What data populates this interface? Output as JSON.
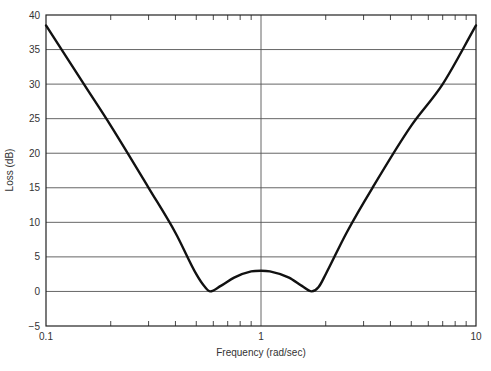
{
  "chart_data": {
    "type": "line",
    "title": "",
    "xlabel": "Frequency (rad/sec)",
    "ylabel": "Loss (dB)",
    "xscale": "log",
    "xlim": [
      0.1,
      10
    ],
    "ylim": [
      -5,
      40
    ],
    "x_tick_labels": [
      "0.1",
      "1",
      "10"
    ],
    "y_tick_labels": [
      "40",
      "35",
      "30",
      "25",
      "20",
      "15",
      "10",
      "5",
      "0",
      "−5"
    ],
    "y_ticks": [
      40,
      35,
      30,
      25,
      20,
      15,
      10,
      5,
      0,
      -5
    ],
    "grid": {
      "horizontal": true,
      "vertical_at": [
        1
      ]
    },
    "legend": null,
    "series": [
      {
        "name": "Loss",
        "x": [
          0.1,
          0.15,
          0.2,
          0.3,
          0.4,
          0.5,
          0.55,
          0.58,
          0.65,
          0.75,
          0.9,
          1.0,
          1.1,
          1.35,
          1.55,
          1.72,
          1.85,
          2.0,
          2.5,
          3.3,
          5.0,
          7.0,
          10.0
        ],
        "values": [
          38.5,
          30.0,
          24.0,
          15.0,
          8.5,
          2.5,
          0.6,
          0.0,
          0.8,
          2.0,
          2.9,
          3.0,
          2.9,
          2.0,
          0.8,
          0.0,
          0.6,
          2.5,
          8.5,
          15.0,
          24.0,
          30.0,
          38.5
        ]
      }
    ]
  }
}
